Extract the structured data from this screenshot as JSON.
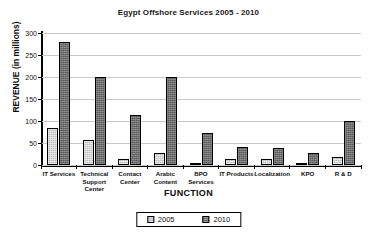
{
  "chart_data": {
    "type": "bar",
    "title": "Egypt Offshore Services 2005 - 2010",
    "xlabel": "FUNCTION",
    "ylabel": "REVENUE (in millions)",
    "ylim": [
      0,
      300
    ],
    "yticks": [
      0,
      50,
      100,
      150,
      200,
      250,
      300
    ],
    "grid": true,
    "legend_position": "bottom-center",
    "categories": [
      "IT Services",
      "Technical Support Center",
      "Contact Center",
      "Arabic Content",
      "BPO Services",
      "IT Products",
      "Localization",
      "KPO",
      "R & D"
    ],
    "series": [
      {
        "name": "2005",
        "color": "#bdbdbd",
        "values": [
          85,
          57,
          13,
          28,
          3,
          13,
          13,
          3,
          18
        ]
      },
      {
        "name": "2010",
        "color": "#585858",
        "values": [
          280,
          200,
          114,
          200,
          72,
          42,
          38,
          28,
          99
        ]
      }
    ]
  },
  "legend": {
    "items": [
      {
        "label": "2005"
      },
      {
        "label": "2010"
      }
    ]
  }
}
